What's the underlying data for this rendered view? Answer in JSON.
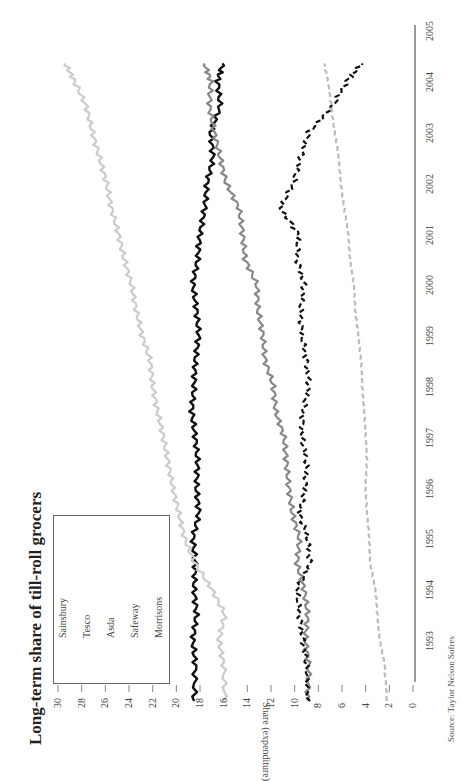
{
  "chart_data": {
    "type": "line",
    "title": "Long-term share of till-roll grocers",
    "xlabel": "",
    "ylabel": "Share (expenditure)",
    "source": "Source: Taylor Nelson Sofres",
    "ylim": [
      0,
      30
    ],
    "yticks": [
      0,
      2,
      4,
      6,
      8,
      10,
      12,
      14,
      16,
      18,
      20,
      22,
      24,
      26,
      28,
      30
    ],
    "xticks": [
      "1993",
      "1994",
      "1995",
      "1996",
      "1997",
      "1998",
      "1999",
      "2000",
      "2001",
      "2002",
      "2003",
      "2004",
      "2005"
    ],
    "xlim": [
      1992.3,
      2005.0
    ],
    "orientation": "rotated 90 degrees counter-clockwise",
    "legend_position": "upper-left (of rotated chart)",
    "x": [
      1992.3,
      1993.0,
      1993.5,
      1994.0,
      1994.5,
      1995.0,
      1995.5,
      1996.0,
      1996.5,
      1997.0,
      1997.5,
      1998.0,
      1998.5,
      1999.0,
      1999.5,
      2000.0,
      2000.5,
      2001.0,
      2001.5,
      2002.0,
      2002.5,
      2003.0,
      2003.5,
      2004.0,
      2004.5,
      2004.85
    ],
    "series": [
      {
        "name": "Sainsbury",
        "style": "solid",
        "color": "#111111",
        "values": [
          18.5,
          18.4,
          18.6,
          18.3,
          18.5,
          18.4,
          18.6,
          18.1,
          18.3,
          18.2,
          18.4,
          18.7,
          18.5,
          18.4,
          18.1,
          18.3,
          18.6,
          18.2,
          18.0,
          17.6,
          17.4,
          16.9,
          17.1,
          16.3,
          16.5,
          16.1
        ]
      },
      {
        "name": "Tesco",
        "style": "solid",
        "color": "#cccccc",
        "values": [
          15.9,
          16.0,
          16.4,
          15.9,
          17.0,
          18.4,
          19.3,
          19.8,
          20.3,
          20.7,
          21.1,
          21.6,
          22.0,
          22.2,
          22.9,
          23.4,
          23.8,
          24.4,
          24.9,
          25.5,
          25.9,
          26.5,
          27.1,
          27.6,
          28.6,
          29.4
        ]
      },
      {
        "name": "Asda",
        "style": "solid",
        "color": "#888888",
        "values": [
          8.9,
          8.8,
          9.1,
          8.9,
          9.2,
          9.8,
          9.6,
          10.2,
          10.5,
          10.7,
          10.9,
          11.6,
          11.8,
          12.5,
          12.7,
          13.1,
          13.2,
          14.2,
          14.4,
          14.7,
          15.8,
          16.3,
          16.8,
          17.2,
          17.1,
          17.6
        ]
      },
      {
        "name": "Safeway",
        "style": "dashed",
        "color": "#111111",
        "values": [
          8.9,
          9.0,
          9.3,
          9.6,
          9.8,
          8.7,
          8.9,
          9.6,
          9.1,
          9.0,
          9.4,
          9.3,
          8.8,
          9.0,
          9.4,
          9.5,
          9.2,
          9.8,
          9.7,
          11.2,
          10.1,
          9.5,
          8.8,
          6.8,
          5.6,
          4.3
        ]
      },
      {
        "name": "Morrisons",
        "style": "dashed",
        "color": "#bbbbbb",
        "values": [
          2.2,
          2.4,
          2.8,
          3.0,
          3.2,
          3.6,
          3.7,
          3.9,
          4.0,
          3.9,
          4.0,
          4.1,
          4.3,
          4.4,
          4.6,
          4.9,
          5.0,
          5.3,
          5.5,
          5.8,
          6.1,
          6.3,
          6.6,
          6.9,
          7.2,
          7.5
        ]
      }
    ]
  },
  "labels": {
    "title": "Long-term share of till-roll grocers",
    "ylabel": "Share (expenditure)",
    "source": "Source: Taylor Nelson Sofres",
    "legend": [
      "Sainsbury",
      "Tesco",
      "Asda",
      "Safeway",
      "Morrisons"
    ],
    "yticks": [
      "30",
      "28",
      "26",
      "24",
      "22",
      "20",
      "18",
      "16",
      "14",
      "12",
      "10",
      "8",
      "6",
      "4",
      "2",
      "0"
    ],
    "years": [
      "1993",
      "1994",
      "1995",
      "1996",
      "1997",
      "1998",
      "1999",
      "2000",
      "2001",
      "2002",
      "2003",
      "2004",
      "2005"
    ]
  }
}
